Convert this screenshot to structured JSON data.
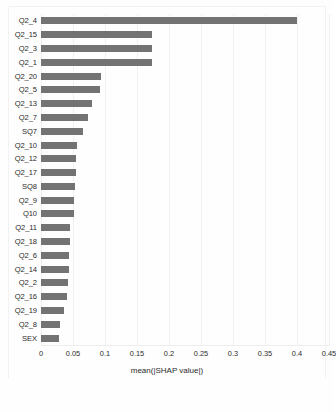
{
  "chart_data": {
    "type": "bar",
    "orientation": "horizontal",
    "title": "",
    "xlabel": "mean(|SHAP value|)",
    "ylabel": "",
    "xlim": [
      0,
      0.45
    ],
    "xticks": [
      "0",
      "0.05",
      "0.1",
      "0.15",
      "0.2",
      "0.25",
      "0.3",
      "0.35",
      "0.4",
      "0.45"
    ],
    "xtick_values": [
      0,
      0.05,
      0.1,
      0.15,
      0.2,
      0.25,
      0.3,
      0.35,
      0.4,
      0.45
    ],
    "grid": true,
    "grid_axis": "x",
    "legend": null,
    "bar_color": "#737373",
    "categories": [
      "Q2_4",
      "Q2_15",
      "Q2_3",
      "Q2_1",
      "Q2_20",
      "Q2_5",
      "Q2_13",
      "Q2_7",
      "SQ7",
      "Q2_10",
      "Q2_12",
      "Q2_17",
      "SQ8",
      "Q2_9",
      "Q10",
      "Q2_11",
      "Q2_18",
      "Q2_6",
      "Q2_14",
      "Q2_2",
      "Q2_16",
      "Q2_19",
      "Q2_8",
      "SEX"
    ],
    "values": [
      0.4,
      0.174,
      0.174,
      0.173,
      0.093,
      0.092,
      0.08,
      0.073,
      0.065,
      0.056,
      0.055,
      0.054,
      0.053,
      0.052,
      0.051,
      0.046,
      0.045,
      0.044,
      0.043,
      0.042,
      0.041,
      0.036,
      0.03,
      0.028
    ]
  }
}
